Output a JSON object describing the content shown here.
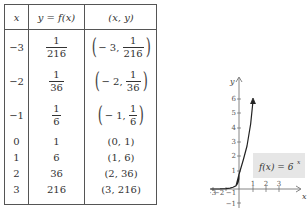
{
  "table": {
    "headers": [
      "x",
      "y = f(x)",
      "(x, y)"
    ],
    "rows": [
      {
        "x": "−3",
        "y_num": "1",
        "y_den": "216",
        "pt_x": "− 3,",
        "pt_num": "1",
        "pt_den": "216",
        "fraction": true
      },
      {
        "x": "−2",
        "y_num": "1",
        "y_den": "36",
        "pt_x": "− 2,",
        "pt_num": "1",
        "pt_den": "36",
        "fraction": true
      },
      {
        "x": "−1",
        "y_num": "1",
        "y_den": "6",
        "pt_x": "− 1,",
        "pt_num": "1",
        "pt_den": "6",
        "fraction": true
      },
      {
        "x": "0",
        "y": "1",
        "pt": "(0, 1)",
        "fraction": false
      },
      {
        "x": "1",
        "y": "6",
        "pt": "(1, 6)",
        "fraction": false
      },
      {
        "x": "2",
        "y": "36",
        "pt": "(2, 36)",
        "fraction": false
      },
      {
        "x": "3",
        "y": "216",
        "pt": "(3, 216)",
        "fraction": false
      }
    ]
  },
  "graph": {
    "x_label": "x",
    "y_label": "y",
    "x_ticks": [
      "−3",
      "−2",
      "−1",
      "1",
      "2",
      "3"
    ],
    "y_ticks": [
      "6",
      "5",
      "4",
      "3",
      "2",
      "1",
      "−1"
    ],
    "function_label": "f(x) = 6",
    "function_exponent": "x",
    "label_bg": "#e6e6e6",
    "curve_color": "#222222"
  }
}
